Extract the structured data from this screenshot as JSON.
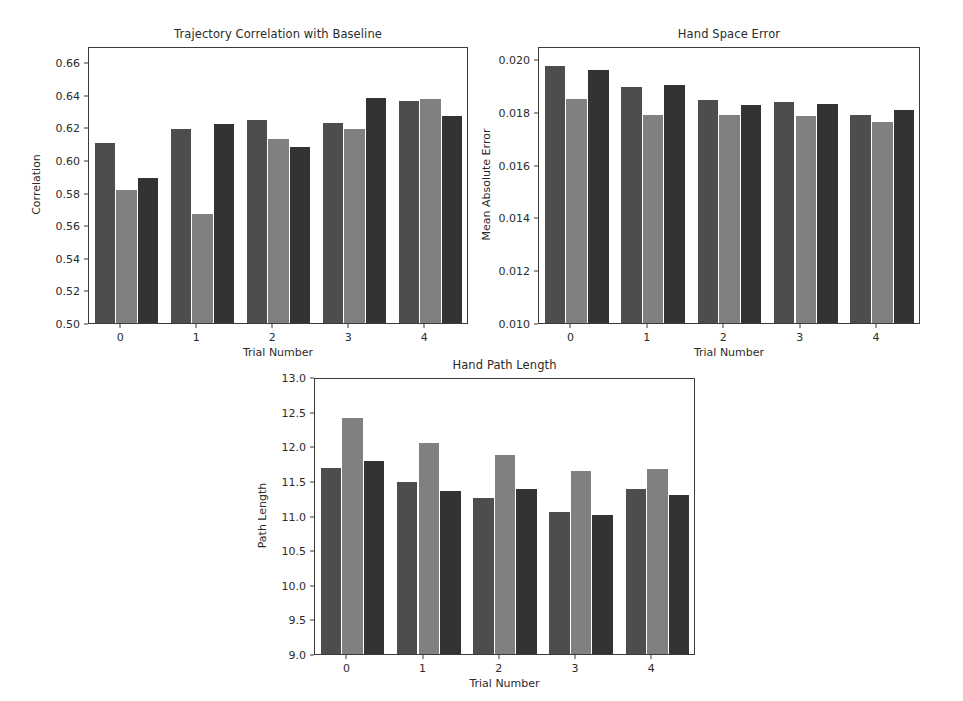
{
  "figure": {
    "background": "#ffffff",
    "series_colors": [
      "#4d4d4d",
      "#808080",
      "#333333"
    ],
    "series_names": [
      "series-1",
      "series-2",
      "series-3"
    ],
    "axis_color": "#3b3b3b",
    "text_color": "#2b2b2b"
  },
  "chart_data": [
    {
      "type": "bar",
      "id": "trajectory-correlation",
      "title": "Trajectory Correlation with Baseline",
      "xlabel": "Trial Number",
      "ylabel": "Correlation",
      "categories": [
        "0",
        "1",
        "2",
        "3",
        "4"
      ],
      "ylim": [
        0.5,
        0.67
      ],
      "yticks": [
        0.5,
        0.52,
        0.54,
        0.56,
        0.58,
        0.6,
        0.62,
        0.64,
        0.66
      ],
      "ytick_labels": [
        "0.50",
        "0.52",
        "0.54",
        "0.56",
        "0.58",
        "0.60",
        "0.62",
        "0.64",
        "0.66"
      ],
      "grid": false,
      "legend": "none",
      "series": [
        {
          "name": "series-1",
          "color": "#4d4d4d",
          "values": [
            0.6105,
            0.619,
            0.6247,
            0.6225,
            0.6362
          ]
        },
        {
          "name": "series-2",
          "color": "#808080",
          "values": [
            0.5818,
            0.5672,
            0.613,
            0.619,
            0.6375
          ]
        },
        {
          "name": "series-3",
          "color": "#333333",
          "values": [
            0.5888,
            0.6222,
            0.6078,
            0.6382,
            0.6272
          ]
        }
      ]
    },
    {
      "type": "bar",
      "id": "hand-space-error",
      "title": "Hand Space Error",
      "xlabel": "Trial Number",
      "ylabel": "Mean Absolute Error",
      "categories": [
        "0",
        "1",
        "2",
        "3",
        "4"
      ],
      "ylim": [
        0.01,
        0.0205
      ],
      "yticks": [
        0.01,
        0.012,
        0.014,
        0.016,
        0.018,
        0.02
      ],
      "ytick_labels": [
        "0.010",
        "0.012",
        "0.014",
        "0.016",
        "0.018",
        "0.020"
      ],
      "grid": false,
      "legend": "none",
      "series": [
        {
          "name": "series-1",
          "color": "#4d4d4d",
          "values": [
            0.01975,
            0.01895,
            0.01845,
            0.01838,
            0.0179
          ]
        },
        {
          "name": "series-2",
          "color": "#808080",
          "values": [
            0.0185,
            0.01787,
            0.01787,
            0.01785,
            0.01762
          ]
        },
        {
          "name": "series-3",
          "color": "#333333",
          "values": [
            0.01958,
            0.01902,
            0.01828,
            0.0183,
            0.01808
          ]
        }
      ]
    },
    {
      "type": "bar",
      "id": "hand-path-length",
      "title": "Hand Path Length",
      "xlabel": "Trial Number",
      "ylabel": "Path Length",
      "categories": [
        "0",
        "1",
        "2",
        "3",
        "4"
      ],
      "ylim": [
        9.0,
        13.0
      ],
      "yticks": [
        9.0,
        9.5,
        10.0,
        10.5,
        11.0,
        11.5,
        12.0,
        12.5,
        13.0
      ],
      "ytick_labels": [
        "9.0",
        "9.5",
        "10.0",
        "10.5",
        "11.0",
        "11.5",
        "12.0",
        "12.5",
        "13.0"
      ],
      "grid": false,
      "legend": "none",
      "series": [
        {
          "name": "series-1",
          "color": "#4d4d4d",
          "values": [
            11.68,
            11.48,
            11.26,
            11.05,
            11.38
          ]
        },
        {
          "name": "series-2",
          "color": "#808080",
          "values": [
            12.41,
            12.05,
            11.88,
            11.64,
            11.67
          ]
        },
        {
          "name": "series-3",
          "color": "#333333",
          "values": [
            11.79,
            11.35,
            11.38,
            11.01,
            11.3
          ]
        }
      ]
    }
  ],
  "layout": {
    "subplots": [
      {
        "id": "trajectory-correlation",
        "left": 88,
        "top": 47,
        "width": 380,
        "height": 277
      },
      {
        "id": "hand-space-error",
        "left": 538,
        "top": 47,
        "width": 382,
        "height": 277
      },
      {
        "id": "hand-path-length",
        "left": 314,
        "top": 378,
        "width": 381,
        "height": 277
      }
    ]
  }
}
